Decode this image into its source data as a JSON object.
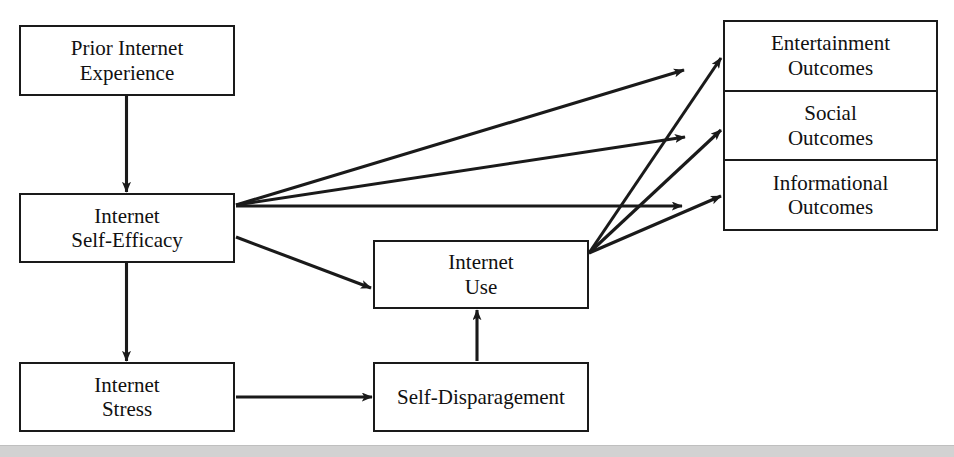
{
  "diagram": {
    "type": "path-model",
    "nodes": {
      "prior_internet_experience": {
        "line1": "Prior Internet",
        "line2": "Experience"
      },
      "internet_self_efficacy": {
        "line1": "Internet",
        "line2": "Self-Efficacy"
      },
      "internet_stress": {
        "line1": "Internet",
        "line2": "Stress"
      },
      "internet_use": {
        "line1": "Internet",
        "line2": "Use"
      },
      "self_disparagement": {
        "line1": "Self-Disparagement",
        "line2": ""
      },
      "entertainment_outcomes": {
        "line1": "Entertainment",
        "line2": "Outcomes"
      },
      "social_outcomes": {
        "line1": "Social",
        "line2": "Outcomes"
      },
      "informational_outcomes": {
        "line1": "Informational",
        "line2": "Outcomes"
      }
    },
    "edges": [
      {
        "from": "prior_internet_experience",
        "to": "internet_self_efficacy",
        "style": "arrow"
      },
      {
        "from": "internet_self_efficacy",
        "to": "internet_stress",
        "style": "arrow"
      },
      {
        "from": "internet_self_efficacy",
        "to": "internet_use",
        "style": "arrow"
      },
      {
        "from": "internet_self_efficacy",
        "to": "entertainment_outcomes",
        "style": "arrow"
      },
      {
        "from": "internet_self_efficacy",
        "to": "social_outcomes",
        "style": "arrow"
      },
      {
        "from": "internet_self_efficacy",
        "to": "informational_outcomes",
        "style": "arrow"
      },
      {
        "from": "internet_stress",
        "to": "self_disparagement",
        "style": "arrow"
      },
      {
        "from": "self_disparagement",
        "to": "internet_use",
        "style": "arrow"
      },
      {
        "from": "internet_use",
        "to": "entertainment_outcomes",
        "style": "arrow"
      },
      {
        "from": "internet_use",
        "to": "social_outcomes",
        "style": "arrow"
      },
      {
        "from": "internet_use",
        "to": "informational_outcomes",
        "style": "arrow"
      }
    ],
    "colors": {
      "stroke": "#1a1a1a",
      "box_fill": "#ffffff",
      "text": "#111111",
      "footer_bar": "#d2d2d2",
      "page_background": "#ffffff"
    }
  }
}
